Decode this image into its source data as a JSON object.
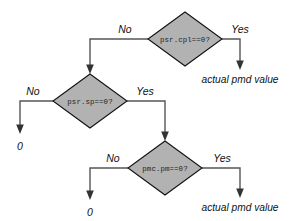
{
  "diagram": {
    "type": "flowchart",
    "title": "",
    "colors": {
      "node_fill": "#b2b2b2",
      "node_stroke": "#111111",
      "connector": "#555555",
      "background": "#ffffff"
    },
    "nodes": [
      {
        "id": "d1",
        "shape": "diamond",
        "label": "psr.cpl==0?"
      },
      {
        "id": "d2",
        "shape": "diamond",
        "label": "psr.sp==0?"
      },
      {
        "id": "d3",
        "shape": "diamond",
        "label": "pmc.pm==0?"
      }
    ],
    "branch_labels": {
      "d1_no": "No",
      "d1_yes": "Yes",
      "d2_no": "No",
      "d2_yes": "Yes",
      "d3_no": "No",
      "d3_yes": "Yes"
    },
    "terminals": [
      {
        "id": "t1",
        "label": "actual pmd value"
      },
      {
        "id": "t2",
        "label": "0"
      },
      {
        "id": "t3",
        "label": "0"
      },
      {
        "id": "t4",
        "label": "actual pmd value"
      }
    ]
  }
}
